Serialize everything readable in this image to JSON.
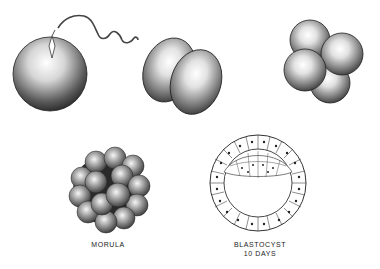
{
  "figure": {
    "stages": [
      {
        "id": "fertilization",
        "description": "Egg with sperm entering"
      },
      {
        "id": "two-cell",
        "description": "Two-cell stage"
      },
      {
        "id": "four-cell",
        "description": "Four-cell stage"
      },
      {
        "id": "morula",
        "label": "MORULA"
      },
      {
        "id": "blastocyst",
        "label_line1": "BLASTOCYST",
        "label_line2": "10 DAYS"
      }
    ]
  }
}
